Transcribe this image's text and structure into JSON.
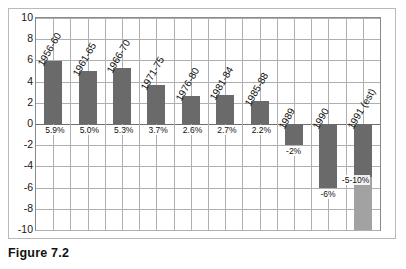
{
  "figure": {
    "caption": "Figure 7.2"
  },
  "chart_data": {
    "type": "bar",
    "title": "",
    "xlabel": "",
    "ylabel": "",
    "ylim": [
      -10,
      10
    ],
    "ytick_labels": [
      "10",
      "8",
      "6",
      "4",
      "2",
      "0",
      "-2",
      "-4",
      "-6",
      "-8",
      "-10"
    ],
    "ytick_values": [
      10,
      8,
      6,
      4,
      2,
      0,
      -2,
      -4,
      -6,
      -8,
      -10
    ],
    "grid": true,
    "legend": "none",
    "categories": [
      "1956-60",
      "1961-65",
      "1966-70",
      "1971-75",
      "1976-80",
      "1981-84",
      "1985-88",
      "1989",
      "1990",
      "1991 (est)"
    ],
    "values": [
      5.9,
      5.0,
      5.3,
      3.7,
      2.6,
      2.7,
      2.2,
      -2.0,
      -6.0,
      -10.0
    ],
    "data_labels": [
      "5.9%",
      "5.0%",
      "5.3%",
      "3.7%",
      "2.6%",
      "2.7%",
      "2.2%",
      "-2%",
      "-6%",
      "-5-10%"
    ],
    "bar_colors": [
      "#6a6a6a",
      "#6a6a6a",
      "#6a6a6a",
      "#6a6a6a",
      "#6a6a6a",
      "#6a6a6a",
      "#6a6a6a",
      "#6a6a6a",
      "#6a6a6a",
      "#6a6a6a"
    ],
    "last_bar_range": {
      "dark_to": -5.0,
      "light_to": -10.0,
      "light_color": "#a2a2a2"
    },
    "axis_color": "#8a8a8a",
    "gridline_color": "#b0b0b0",
    "zero_line_color": "#6f6f6f"
  }
}
